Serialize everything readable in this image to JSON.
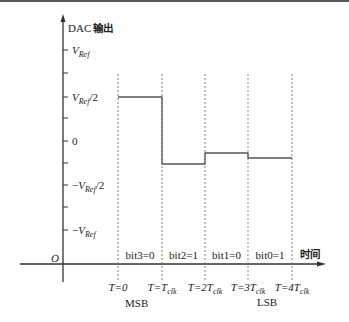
{
  "diagram": {
    "title_y_axis": "DAC 输出",
    "x_axis_label": "时间",
    "origin_label": "O",
    "y_ticks": [
      {
        "label": "V",
        "sub": "Ref",
        "suffix": "",
        "prefix": "",
        "y": 50
      },
      {
        "label": "",
        "y": 73
      },
      {
        "label": "V",
        "sub": "Ref",
        "suffix": "/2",
        "prefix": "",
        "y": 97
      },
      {
        "label": "",
        "y": 118
      },
      {
        "label": "0",
        "sub": "",
        "suffix": "",
        "prefix": "",
        "y": 141,
        "upright": true
      },
      {
        "label": "",
        "y": 163
      },
      {
        "label": "V",
        "sub": "Ref",
        "suffix": "/2",
        "prefix": "−",
        "y": 185
      },
      {
        "label": "",
        "y": 207
      },
      {
        "label": "V",
        "sub": "Ref",
        "suffix": "",
        "prefix": "−",
        "y": 230
      }
    ],
    "time_markers": [
      {
        "x": 118,
        "T": "T",
        "eq": "=0",
        "sub": "",
        "coef": ""
      },
      {
        "x": 162,
        "T": "T",
        "eq": "=T",
        "sub": "clk",
        "coef": ""
      },
      {
        "x": 205,
        "T": "T",
        "eq": "=2T",
        "sub": "clk",
        "coef": ""
      },
      {
        "x": 248,
        "T": "T",
        "eq": "=3T",
        "sub": "clk",
        "coef": ""
      },
      {
        "x": 292,
        "T": "T",
        "eq": "=4T",
        "sub": "clk",
        "coef": ""
      }
    ],
    "bit_labels": [
      "bit3=0",
      "bit2=1",
      "bit1=0",
      "bit0=1"
    ],
    "msb_label": "MSB",
    "lsb_label": "LSB",
    "steps": [
      {
        "x1": 118,
        "x2": 162,
        "y": 97
      },
      {
        "x1": 162,
        "x2": 205,
        "y": 164
      },
      {
        "x1": 205,
        "x2": 248,
        "y": 153
      },
      {
        "x1": 248,
        "x2": 292,
        "y": 158
      }
    ],
    "colors": {
      "axis": "#333333",
      "step": "#555555",
      "dash": "#777777",
      "text": "#222222"
    }
  }
}
